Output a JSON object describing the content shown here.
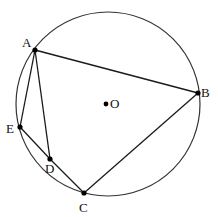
{
  "diagram": {
    "type": "geometry",
    "circle": {
      "center_label": "O"
    },
    "points": [
      {
        "id": "A",
        "label": "A"
      },
      {
        "id": "B",
        "label": "B"
      },
      {
        "id": "C",
        "label": "C"
      },
      {
        "id": "D",
        "label": "D"
      },
      {
        "id": "E",
        "label": "E"
      },
      {
        "id": "O",
        "label": "O"
      }
    ],
    "segments": [
      [
        "A",
        "B"
      ],
      [
        "B",
        "C"
      ],
      [
        "C",
        "D"
      ],
      [
        "D",
        "E"
      ],
      [
        "E",
        "A"
      ],
      [
        "A",
        "D"
      ]
    ]
  }
}
